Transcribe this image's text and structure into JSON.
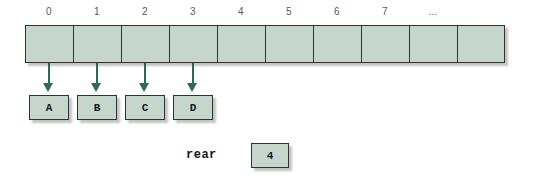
{
  "diagram": {
    "colors": {
      "cell_fill": "#c6d6cd",
      "cell_border": "#2d3530",
      "arrow": "#2f6b4f",
      "label_text": "#555a57",
      "background": "#ffffff"
    },
    "array": {
      "cell_count": 10,
      "index_labels": [
        "0",
        "1",
        "2",
        "3",
        "4",
        "5",
        "6",
        "7",
        "..."
      ],
      "cells": [
        "",
        "",
        "",
        "",
        "",
        "",
        "",
        "",
        "",
        ""
      ]
    },
    "arrows": [
      {
        "from_index": "0",
        "to_box": "A"
      },
      {
        "from_index": "1",
        "to_box": "B"
      },
      {
        "from_index": "2",
        "to_box": "C"
      },
      {
        "from_index": "3",
        "to_box": "D"
      }
    ],
    "data_boxes": [
      {
        "label": "A"
      },
      {
        "label": "B"
      },
      {
        "label": "C"
      },
      {
        "label": "D"
      }
    ],
    "rear": {
      "label": "rear",
      "value": "4"
    }
  }
}
